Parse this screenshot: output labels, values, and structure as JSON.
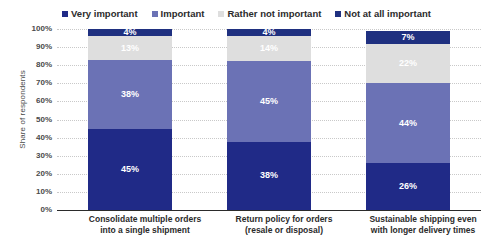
{
  "chart_data": {
    "type": "bar",
    "subtype": "stacked-bar-100",
    "title": "",
    "xlabel": "",
    "ylabel": "Share of respondents",
    "ylim": [
      0,
      100
    ],
    "grid": true,
    "legend_position": "top",
    "categories": [
      "Consolidate multiple orders into a single shipment",
      "Return policy for orders (resale or disposal)",
      "Sustainable shipping even with longer delivery times"
    ],
    "category_lines": [
      [
        "Consolidate multiple orders",
        "into a single shipment"
      ],
      [
        "Return policy for orders",
        "(resale or disposal)"
      ],
      [
        "Sustainable shipping even",
        "with longer delivery times"
      ]
    ],
    "ytick_labels": [
      "0%",
      "10%",
      "20%",
      "30%",
      "40%",
      "50%",
      "60%",
      "70%",
      "80%",
      "90%",
      "100%"
    ],
    "ytick_values": [
      0,
      10,
      20,
      30,
      40,
      50,
      60,
      70,
      80,
      90,
      100
    ],
    "series": [
      {
        "name": "Very important",
        "color": "#202a87",
        "values": [
          45,
          38,
          26
        ],
        "labels": [
          "45%",
          "38%",
          "26%"
        ]
      },
      {
        "name": "Important",
        "color": "#6b72b5",
        "values": [
          38,
          45,
          44
        ],
        "labels": [
          "38%",
          "45%",
          "44%"
        ]
      },
      {
        "name": "Rather not important",
        "color": "#dedede",
        "values": [
          13,
          14,
          22
        ],
        "labels": [
          "13%",
          "14%",
          "22%"
        ]
      },
      {
        "name": "Not at all important",
        "color": "#1f3080",
        "values": [
          4,
          4,
          7
        ],
        "labels": [
          "4%",
          "4%",
          "7%"
        ]
      }
    ]
  },
  "legend": {
    "items": [
      {
        "label": "Very important",
        "color": "#202a87"
      },
      {
        "label": "Important",
        "color": "#6b72b5"
      },
      {
        "label": "Rather not important",
        "color": "#dedede"
      },
      {
        "label": "Not at all important",
        "color": "#1f3080"
      }
    ]
  },
  "axis": {
    "y_title": "Share of respondents"
  }
}
